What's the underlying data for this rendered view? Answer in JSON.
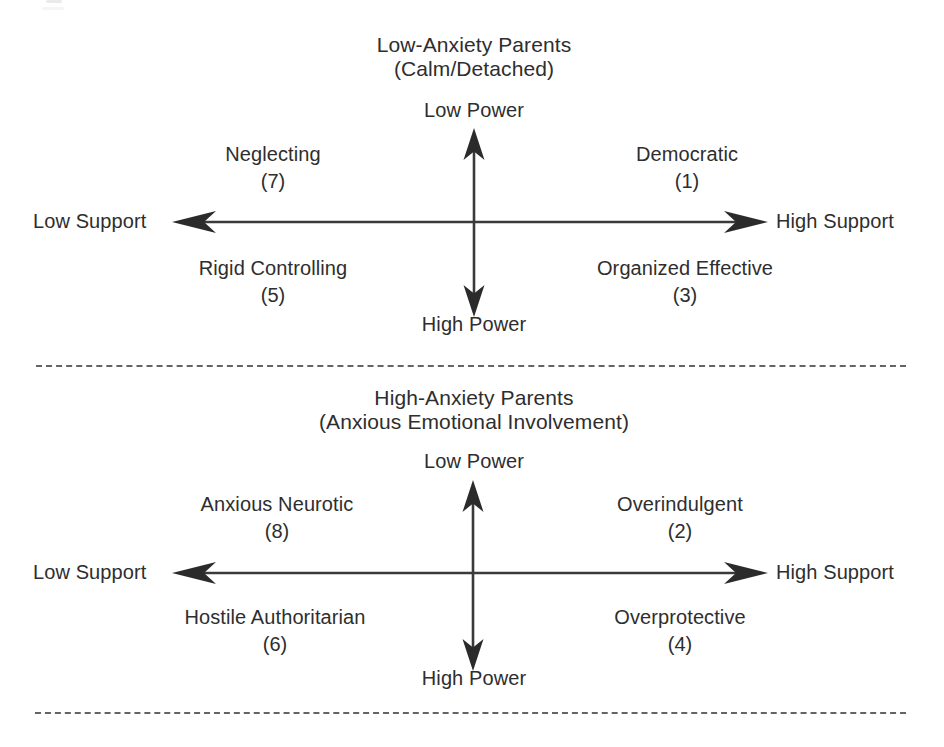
{
  "figure": {
    "width": 944,
    "height": 747,
    "background": "#ffffff",
    "ink_color": "#2e2e2e",
    "line_color": "#3a3a3a",
    "dash_color": "#4a4a4a"
  },
  "panels": [
    {
      "id": "low-anxiety",
      "title": "Low-Anxiety Parents",
      "subtitle": "(Calm/Detached)",
      "axes": {
        "vertical_top_label": "Low Power",
        "vertical_bottom_label": "High Power",
        "horizontal_left_label": "Low Support",
        "horizontal_right_label": "High Support"
      },
      "quadrants": [
        {
          "position": "top-left",
          "name": "Neglecting",
          "number": "(7)"
        },
        {
          "position": "top-right",
          "name": "Democratic",
          "number": "(1)"
        },
        {
          "position": "bottom-left",
          "name": "Rigid Controlling",
          "number": "(5)"
        },
        {
          "position": "bottom-right",
          "name": "Organized Effective",
          "number": "(3)"
        }
      ]
    },
    {
      "id": "high-anxiety",
      "title": "High-Anxiety Parents",
      "subtitle": "(Anxious Emotional Involvement)",
      "axes": {
        "vertical_top_label": "Low Power",
        "vertical_bottom_label": "High Power",
        "horizontal_left_label": "Low Support",
        "horizontal_right_label": "High Support"
      },
      "quadrants": [
        {
          "position": "top-left",
          "name": "Anxious Neurotic",
          "number": "(8)"
        },
        {
          "position": "top-right",
          "name": "Overindulgent",
          "number": "(2)"
        },
        {
          "position": "bottom-left",
          "name": "Hostile Authoritarian",
          "number": "(6)"
        },
        {
          "position": "bottom-right",
          "name": "Overprotective",
          "number": "(4)"
        }
      ]
    }
  ]
}
